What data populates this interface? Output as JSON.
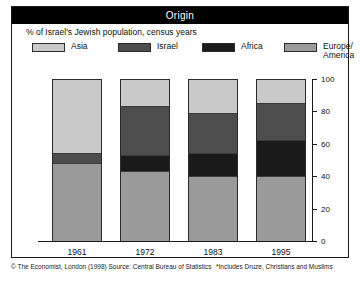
{
  "header": {
    "title": "Origin"
  },
  "subtitle": "% of Israel's Jewish population, census years",
  "legend": [
    {
      "label": "Asia",
      "color": "#c9c9c9"
    },
    {
      "label": "Israel",
      "color": "#4d4d4d"
    },
    {
      "label": "Africa",
      "color": "#1a1a1a"
    },
    {
      "label": "Europe/\nAmerica",
      "color": "#9a9a9a"
    }
  ],
  "footer": {
    "source": "© The Economist, London (1998) Source: Central Bureau of Statistics",
    "note": "*Includes Druze, Christians and Muslims"
  },
  "chart_data": {
    "type": "bar",
    "title": "Origin",
    "subtitle": "% of Israel's Jewish population, census years",
    "xlabel": "",
    "ylabel": "",
    "ylim": [
      0,
      100
    ],
    "yticks": [
      0,
      20,
      40,
      60,
      80,
      100
    ],
    "ytick_labels": [
      "0",
      "20",
      "40",
      "60",
      "80",
      "100"
    ],
    "grid": false,
    "stacked": true,
    "legend_position": "top",
    "categories": [
      "1961",
      "1972",
      "1983",
      "1995"
    ],
    "series": [
      {
        "name": "Asia",
        "color": "#c9c9c9",
        "values": [
          46,
          17,
          21,
          15
        ]
      },
      {
        "name": "Israel",
        "color": "#4d4d4d",
        "values": [
          6,
          30,
          25,
          23
        ]
      },
      {
        "name": "Africa",
        "color": "#1a1a1a",
        "values": [
          0,
          10,
          14,
          22
        ]
      },
      {
        "name": "Europe/America",
        "color": "#9a9a9a",
        "values": [
          48,
          43,
          40,
          40
        ]
      }
    ]
  }
}
